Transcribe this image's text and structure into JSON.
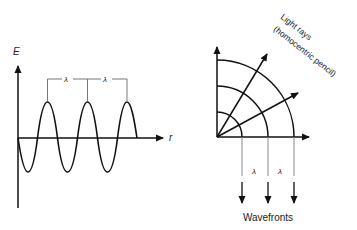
{
  "left_diagram": {
    "y_axis_label": "E",
    "x_axis_label": "r",
    "wavelength_labels": [
      "λ",
      "λ"
    ]
  },
  "right_diagram": {
    "rays_label_line1": "Light rays",
    "rays_label_line2": "(homocentric pencil)",
    "wavelength_labels": [
      "λ",
      "λ"
    ],
    "bottom_label": "Wavefronts"
  },
  "colors": {
    "stroke": "#111111",
    "guide": "#888888"
  }
}
